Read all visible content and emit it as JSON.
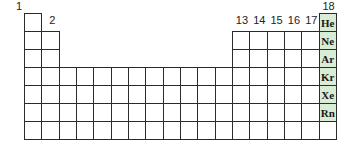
{
  "group_labels": {
    "g1": "1",
    "g2": "2",
    "g13": "13",
    "g14": "14",
    "g15": "15",
    "g16": "16",
    "g17": "17",
    "g18": "18"
  },
  "noble_gases": [
    "He",
    "Ne",
    "Ar",
    "Kr",
    "Xe",
    "Rn",
    ""
  ],
  "highlight_color": "#d9ecd6",
  "grid": {
    "columns": 18,
    "rows": 7,
    "period1_cells": [
      1,
      18
    ],
    "period2_3_cells": [
      1,
      2,
      13,
      14,
      15,
      16,
      17,
      18
    ],
    "period4_7_cells": "1-18"
  }
}
